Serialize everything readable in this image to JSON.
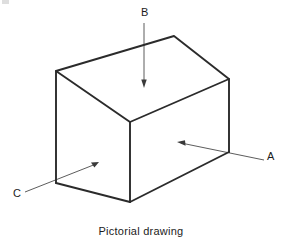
{
  "figure": {
    "caption": "Pictorial drawing",
    "type": "isometric-box-line-drawing",
    "background_color": "#ffffff",
    "line_color": "#2b2b2b",
    "leader_color": "#4a4a4a",
    "text_color": "#1c1c1c",
    "callouts": [
      {
        "id": "A",
        "label": "A",
        "points_to": "right-front-vertical-face",
        "label_x": 267,
        "label_y": 151,
        "line_from": [
          264,
          160
        ],
        "line_to": [
          180,
          143
        ],
        "arrow_tip": [
          178,
          142
        ]
      },
      {
        "id": "B",
        "label": "B",
        "points_to": "top-horizontal-face",
        "label_x": 141,
        "label_y": 7,
        "line_from": [
          144,
          23
        ],
        "line_to": [
          144,
          80
        ],
        "arrow_tip": [
          144,
          87
        ]
      },
      {
        "id": "C",
        "label": "C",
        "points_to": "left-side-vertical-face",
        "label_x": 13,
        "label_y": 188,
        "line_from": [
          25,
          192
        ],
        "line_to": [
          95,
          165
        ],
        "arrow_tip": [
          99,
          162
        ]
      }
    ],
    "geometry": {
      "vertices": {
        "left_top": [
          56,
          71
        ],
        "peak_top": [
          174,
          36
        ],
        "right_top": [
          229,
          79
        ],
        "front_top": [
          130,
          122
        ],
        "left_bottom": [
          56,
          183
        ],
        "front_bottom": [
          130,
          202
        ],
        "right_bottom": [
          229,
          152
        ]
      },
      "visible_faces": [
        "top",
        "left",
        "right-front"
      ],
      "hidden_edges_shown": false
    }
  }
}
